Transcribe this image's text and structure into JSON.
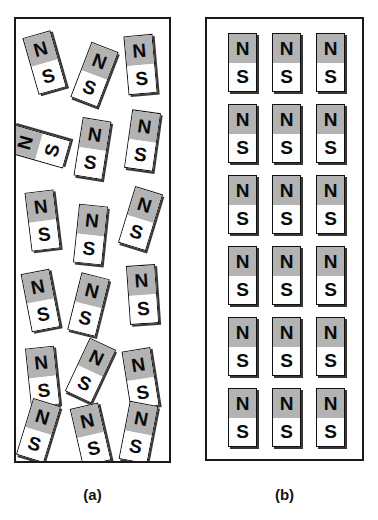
{
  "figure": {
    "pole_north": "N",
    "pole_south": "S",
    "colors": {
      "north_fill": "#b3b3b3",
      "south_fill": "#fdfdfd",
      "outline": "#111111",
      "shadow": "#141414",
      "background": "#ffffff"
    }
  },
  "panels": [
    {
      "id": "a",
      "caption": "(a)",
      "description": "Unmagnetized material: magnetic domains randomly oriented",
      "magnet_count": 18,
      "arrangement": "random",
      "magnets": [
        {
          "x": 14,
          "y": 14,
          "rot": -16
        },
        {
          "x": 64,
          "y": 26,
          "rot": 21
        },
        {
          "x": 110,
          "y": 16,
          "rot": -5
        },
        {
          "x": 8,
          "y": 98,
          "rot": -74
        },
        {
          "x": 62,
          "y": 100,
          "rot": 9
        },
        {
          "x": 112,
          "y": 92,
          "rot": 8
        },
        {
          "x": 12,
          "y": 172,
          "rot": -7
        },
        {
          "x": 60,
          "y": 186,
          "rot": 6
        },
        {
          "x": 110,
          "y": 170,
          "rot": 17
        },
        {
          "x": 10,
          "y": 252,
          "rot": -11
        },
        {
          "x": 58,
          "y": 256,
          "rot": 14
        },
        {
          "x": 112,
          "y": 246,
          "rot": -4
        },
        {
          "x": 12,
          "y": 328,
          "rot": -6
        },
        {
          "x": 60,
          "y": 322,
          "rot": 25
        },
        {
          "x": 110,
          "y": 330,
          "rot": -9
        },
        {
          "x": 8,
          "y": 382,
          "rot": 17
        },
        {
          "x": 60,
          "y": 386,
          "rot": -13
        },
        {
          "x": 108,
          "y": 384,
          "rot": 11
        }
      ]
    },
    {
      "id": "b",
      "caption": "(b)",
      "description": "Magnetized material: magnetic domains aligned",
      "magnet_count": 18,
      "arrangement": "aligned-grid",
      "grid": {
        "rows": 6,
        "cols": 3
      },
      "magnets": [
        {
          "x": 21,
          "y": 14,
          "rot": 0
        },
        {
          "x": 65,
          "y": 14,
          "rot": 0
        },
        {
          "x": 109,
          "y": 14,
          "rot": 0
        },
        {
          "x": 21,
          "y": 85,
          "rot": 0
        },
        {
          "x": 65,
          "y": 85,
          "rot": 0
        },
        {
          "x": 109,
          "y": 85,
          "rot": 0
        },
        {
          "x": 21,
          "y": 156,
          "rot": 0
        },
        {
          "x": 65,
          "y": 156,
          "rot": 0
        },
        {
          "x": 109,
          "y": 156,
          "rot": 0
        },
        {
          "x": 21,
          "y": 227,
          "rot": 0
        },
        {
          "x": 65,
          "y": 227,
          "rot": 0
        },
        {
          "x": 109,
          "y": 227,
          "rot": 0
        },
        {
          "x": 21,
          "y": 298,
          "rot": 0
        },
        {
          "x": 65,
          "y": 298,
          "rot": 0
        },
        {
          "x": 109,
          "y": 298,
          "rot": 0
        },
        {
          "x": 21,
          "y": 369,
          "rot": 0
        },
        {
          "x": 65,
          "y": 369,
          "rot": 0
        },
        {
          "x": 109,
          "y": 369,
          "rot": 0
        }
      ]
    }
  ]
}
